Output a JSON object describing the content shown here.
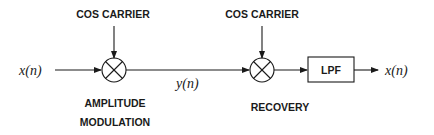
{
  "diagram": {
    "type": "block-diagram",
    "colors": {
      "stroke": "#1a1a1a",
      "background": "#ffffff"
    },
    "input_signal": "x(n)",
    "modulated_signal": "y(n)",
    "output_signal": "x(n)",
    "modulator": {
      "carrier_label": "COS CARRIER",
      "caption_line1": "AMPLITUDE",
      "caption_line2": "MODULATION",
      "symbol": "multiplier-circle-x"
    },
    "demodulator": {
      "carrier_label": "COS CARRIER",
      "caption": "RECOVERY",
      "symbol": "multiplier-circle-x"
    },
    "filter": {
      "label": "LPF"
    }
  }
}
